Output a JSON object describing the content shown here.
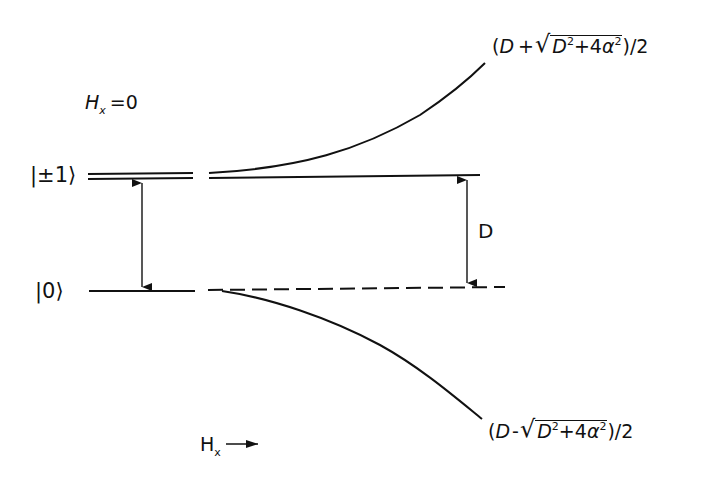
{
  "diagram": {
    "type": "energy-level-diagram",
    "title_condition": {
      "symbol": "H",
      "subscript": "x",
      "equals": "=0"
    },
    "levels": [
      {
        "label": "|±1⟩",
        "kind": "doubly-degenerate"
      },
      {
        "label": "|0⟩",
        "kind": "single"
      }
    ],
    "gap_label": "D",
    "axis": {
      "symbol": "H",
      "subscript": "x",
      "arrow": "→"
    },
    "upper_branch": {
      "open": "(",
      "D": "D",
      "plus_minus": "+",
      "radical": "√",
      "inner_D": "D",
      "inner_exp": "2",
      "plus": "+4",
      "alpha": "α",
      "alpha_exp": "2",
      "close": ")/2"
    },
    "lower_branch": {
      "open": "(",
      "D": "D",
      "plus_minus": "-",
      "radical": "√",
      "inner_D": "D",
      "inner_exp": "2",
      "plus": "+4",
      "alpha": "α",
      "alpha_exp": "2",
      "close": ")/2"
    },
    "colors": {
      "ink": "#111111",
      "background": "#ffffff"
    }
  }
}
